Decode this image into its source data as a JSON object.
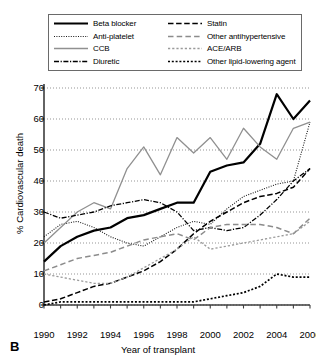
{
  "panel": {
    "letter": "B"
  },
  "legend": {
    "entries": [
      {
        "label": "Beta blocker",
        "style": "solid-thick-black",
        "color": "#000000",
        "column": 0
      },
      {
        "label": "Anti-platelet",
        "style": "fine-dotted-black",
        "color": "#1a1a1a",
        "column": 0
      },
      {
        "label": "CCB",
        "style": "solid-gray",
        "color": "#909090",
        "column": 0
      },
      {
        "label": "Diuretic",
        "style": "dash-dot-black",
        "color": "#000000",
        "column": 0
      },
      {
        "label": "Statin",
        "style": "dashed-black",
        "color": "#000000",
        "column": 1
      },
      {
        "label": "Other antihypertensive",
        "style": "dashed-gray",
        "color": "#8c8c8c",
        "column": 1
      },
      {
        "label": "ACE/ARB",
        "style": "dotted-gray",
        "color": "#9a9a9a",
        "column": 1
      },
      {
        "label": "Other lipid-lowering agent",
        "style": "square-dotted-black",
        "color": "#000000",
        "column": 1
      }
    ]
  },
  "chart_data": {
    "type": "line",
    "title": "",
    "xlabel": "Year of transplant",
    "ylabel": "% Cardiovascular death",
    "xlim": [
      1990,
      2006
    ],
    "ylim": [
      0,
      70
    ],
    "grid": "horizontal-dotted",
    "legend_position": "top",
    "xticks": [
      1990,
      1992,
      1994,
      1996,
      1998,
      2000,
      2002,
      2004,
      2006
    ],
    "xticks_minor_step": 1,
    "yticks": [
      0,
      10,
      20,
      30,
      40,
      50,
      60,
      70
    ],
    "x": [
      1990,
      1991,
      1992,
      1993,
      1994,
      1995,
      1996,
      1997,
      1998,
      1999,
      2000,
      2001,
      2002,
      2003,
      2004,
      2005,
      2006
    ],
    "series": [
      {
        "name": "Beta blocker",
        "style": "solid-thick-black",
        "color": "#000000",
        "values": [
          14,
          19,
          22,
          24,
          25,
          28,
          29,
          31,
          33,
          33,
          43,
          45,
          46,
          52,
          68,
          60,
          66
        ]
      },
      {
        "name": "Anti-platelet",
        "style": "fine-dotted-black",
        "color": "#1a1a1a",
        "values": [
          22,
          26,
          27,
          25,
          22,
          20,
          19,
          22,
          25,
          27,
          26,
          31,
          35,
          37,
          39,
          40,
          59
        ]
      },
      {
        "name": "CCB",
        "style": "solid-gray",
        "color": "#909090",
        "values": [
          20,
          25,
          30,
          33,
          31,
          44,
          51,
          42,
          54,
          49,
          54,
          47,
          57,
          51,
          47,
          57,
          59
        ]
      },
      {
        "name": "Diuretic",
        "style": "dash-dot-black",
        "color": "#000000",
        "values": [
          30,
          28,
          29,
          30,
          32,
          33,
          34,
          33,
          30,
          24,
          25,
          24,
          25,
          29,
          34,
          40,
          44
        ]
      },
      {
        "name": "Statin",
        "style": "dashed-black",
        "color": "#000000",
        "values": [
          1,
          2,
          4,
          6,
          7,
          9,
          11,
          14,
          18,
          23,
          27,
          30,
          33,
          35,
          36,
          38,
          44
        ]
      },
      {
        "name": "Other antihypertensive",
        "style": "dashed-gray",
        "color": "#8c8c8c",
        "values": [
          11,
          13,
          15,
          16,
          17,
          19,
          21,
          22,
          23,
          21,
          25,
          26,
          26,
          26,
          25,
          23,
          28
        ]
      },
      {
        "name": "ACE/ARB",
        "style": "dotted-gray",
        "color": "#9a9a9a",
        "values": [
          10,
          9,
          8,
          7,
          7,
          9,
          12,
          15,
          18,
          22,
          18,
          19,
          20,
          21,
          22,
          23,
          27
        ]
      },
      {
        "name": "Other lipid-lowering agent",
        "style": "square-dotted-black",
        "color": "#000000",
        "values": [
          0,
          1,
          1,
          1,
          1,
          1,
          1,
          1,
          1,
          1,
          2,
          3,
          4,
          6,
          10,
          9,
          9
        ]
      }
    ]
  }
}
